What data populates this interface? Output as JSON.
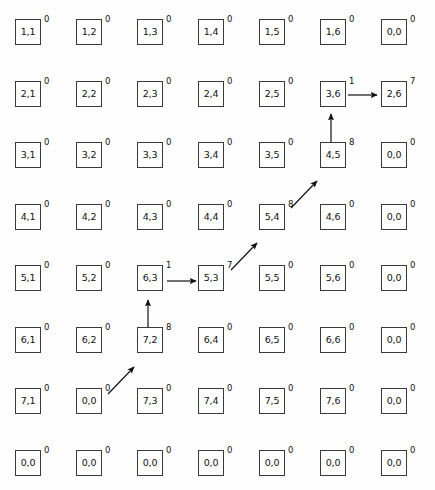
{
  "diagram": {
    "grid_rows": 8,
    "grid_cols": 7,
    "box_size": 26,
    "col_step": 61,
    "row_step": 61.5,
    "origin_x": 15,
    "origin_y": 19,
    "colors": {
      "background": "#fefefe",
      "box_border": "#3a3a3a",
      "box_fill": "#ffffff",
      "text": "#111111",
      "arrow": "#111111"
    },
    "cells": [
      [
        {
          "label": "1,1",
          "sup": "0"
        },
        {
          "label": "1,2",
          "sup": "0"
        },
        {
          "label": "1,3",
          "sup": "0"
        },
        {
          "label": "1,4",
          "sup": "0"
        },
        {
          "label": "1,5",
          "sup": "0"
        },
        {
          "label": "1,6",
          "sup": "0"
        },
        {
          "label": "0,0",
          "sup": "0"
        }
      ],
      [
        {
          "label": "2,1",
          "sup": "0"
        },
        {
          "label": "2,2",
          "sup": "0"
        },
        {
          "label": "2,3",
          "sup": "0"
        },
        {
          "label": "2,4",
          "sup": "0"
        },
        {
          "label": "2,5",
          "sup": "0"
        },
        {
          "label": "3,6",
          "sup": "1"
        },
        {
          "label": "2,6",
          "sup": "7"
        }
      ],
      [
        {
          "label": "3,1",
          "sup": "0"
        },
        {
          "label": "3,2",
          "sup": "0"
        },
        {
          "label": "3,3",
          "sup": "0"
        },
        {
          "label": "3,4",
          "sup": "0"
        },
        {
          "label": "3,5",
          "sup": "0"
        },
        {
          "label": "4,5",
          "sup": "8"
        },
        {
          "label": "0,0",
          "sup": "0"
        }
      ],
      [
        {
          "label": "4,1",
          "sup": "0"
        },
        {
          "label": "4,2",
          "sup": "0"
        },
        {
          "label": "4,3",
          "sup": "0"
        },
        {
          "label": "4,4",
          "sup": "0"
        },
        {
          "label": "5,4",
          "sup": "8"
        },
        {
          "label": "4,6",
          "sup": "0"
        },
        {
          "label": "0,0",
          "sup": "0"
        }
      ],
      [
        {
          "label": "5,1",
          "sup": "0"
        },
        {
          "label": "5,2",
          "sup": "0"
        },
        {
          "label": "6,3",
          "sup": "1"
        },
        {
          "label": "5,3",
          "sup": "7"
        },
        {
          "label": "5,5",
          "sup": "0"
        },
        {
          "label": "5,6",
          "sup": "0"
        },
        {
          "label": "0,0",
          "sup": "0"
        }
      ],
      [
        {
          "label": "6,1",
          "sup": "0"
        },
        {
          "label": "6,2",
          "sup": "0"
        },
        {
          "label": "7,2",
          "sup": "8"
        },
        {
          "label": "6,4",
          "sup": "0"
        },
        {
          "label": "6,5",
          "sup": "0"
        },
        {
          "label": "6,6",
          "sup": "0"
        },
        {
          "label": "0,0",
          "sup": "0"
        }
      ],
      [
        {
          "label": "7,1",
          "sup": "0"
        },
        {
          "label": "0,0",
          "sup": "0"
        },
        {
          "label": "7,3",
          "sup": "0"
        },
        {
          "label": "7,4",
          "sup": "0"
        },
        {
          "label": "7,5",
          "sup": "0"
        },
        {
          "label": "7,6",
          "sup": "0"
        },
        {
          "label": "0,0",
          "sup": "0"
        }
      ],
      [
        {
          "label": "0,0",
          "sup": "0"
        },
        {
          "label": "0,0",
          "sup": "0"
        },
        {
          "label": "0,0",
          "sup": "0"
        },
        {
          "label": "0,0",
          "sup": "0"
        },
        {
          "label": "0,0",
          "sup": "0"
        },
        {
          "label": "0,0",
          "sup": "0"
        },
        {
          "label": "0,0",
          "sup": "0"
        }
      ]
    ],
    "arrows": [
      {
        "name": "arrow-36-to-26",
        "kind": "horizontal",
        "from": "3,6",
        "to": "2,6",
        "x1": 348,
        "y1": 95,
        "x2": 377,
        "y2": 95
      },
      {
        "name": "arrow-45-to-36",
        "kind": "vertical",
        "from": "4,5",
        "to": "3,6",
        "x1": 331,
        "y1": 143,
        "x2": 331,
        "y2": 114
      },
      {
        "name": "arrow-54-to-45",
        "kind": "diagonal",
        "from": "5,4",
        "to": "4,5",
        "x1": 291,
        "y1": 208,
        "x2": 317,
        "y2": 181
      },
      {
        "name": "arrow-53-to-54",
        "kind": "diagonal",
        "from": "5,3",
        "to": "5,4",
        "x1": 231,
        "y1": 270,
        "x2": 257,
        "y2": 243
      },
      {
        "name": "arrow-63-to-53",
        "kind": "horizontal",
        "from": "6,3",
        "to": "5,3",
        "x1": 167,
        "y1": 281,
        "x2": 196,
        "y2": 281
      },
      {
        "name": "arrow-72-to-63",
        "kind": "vertical",
        "from": "7,2",
        "to": "6,3",
        "x1": 148,
        "y1": 329,
        "x2": 148,
        "y2": 300
      },
      {
        "name": "arrow-00-to-72",
        "kind": "diagonal",
        "from": "0,0",
        "to": "7,2",
        "x1": 108,
        "y1": 394,
        "x2": 134,
        "y2": 367
      }
    ]
  }
}
